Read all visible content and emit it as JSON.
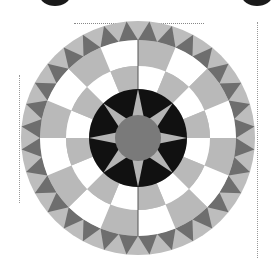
{
  "figure": {
    "width": 276,
    "height": 266,
    "background": "#ffffff"
  },
  "compass": {
    "center": [
      138,
      138
    ],
    "colors": {
      "center_disc": "#7a7a7a",
      "star_ground": "#111111",
      "star_points": "#b4b4b4",
      "checker_light": "#ffffff",
      "checker_gray": "#b9b9b9",
      "saw_light": "#bdbdbd",
      "saw_dark": "#6e6e6e",
      "seam": "#555555"
    },
    "rings": {
      "center_radius": 23,
      "star_outer_radius": 49,
      "checker_inner": {
        "r_in": 49,
        "r_out": 72,
        "segments": 16,
        "first_light": false
      },
      "checker_outer": {
        "r_in": 72,
        "r_out": 98,
        "segments": 16,
        "first_light": true
      },
      "sawtooth": {
        "r_in": 98,
        "r_out": 117,
        "teeth": 32
      }
    },
    "star": {
      "points": 8,
      "rotation_deg": 0
    }
  },
  "decorations": {
    "corner_blobs": [
      {
        "x": 40,
        "y": -14,
        "w": 30,
        "h": 20
      },
      {
        "x": 242,
        "y": -14,
        "w": 30,
        "h": 20
      }
    ],
    "guides": {
      "top": {
        "x": 74,
        "y": 23,
        "length": 130
      },
      "right": {
        "x": 257,
        "y": 22,
        "length": 236
      },
      "left": {
        "x": 19,
        "y": 75,
        "length": 128
      }
    }
  }
}
